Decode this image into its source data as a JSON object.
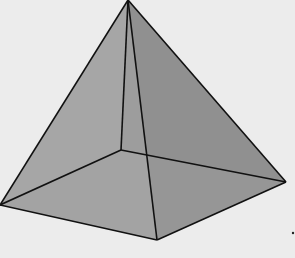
{
  "diagram": {
    "style": "translucent grey faces with black edges, hidden back edges visible",
    "colors": {
      "background": "#ececec",
      "left_face": "#a3a3a3",
      "right_face": "#8c8c8c",
      "front_face": "#979797",
      "base": "#a0a0a0",
      "edge": "#111111"
    },
    "vertices": {
      "apex": [
        128,
        0
      ],
      "left": [
        0,
        205
      ],
      "front": [
        157,
        240
      ],
      "right": [
        286,
        182
      ],
      "back": [
        121,
        150
      ]
    }
  }
}
